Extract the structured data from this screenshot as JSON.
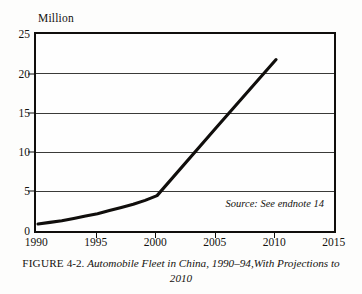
{
  "unit_label": "Million",
  "source_note": "Source: See endnote 14",
  "caption": {
    "figure_label": "FIGURE",
    "figure_number": "4-2.",
    "title": "Automobile Fleet in China, 1990–94,With Projections to 2010"
  },
  "colors": {
    "line": "#100e0c",
    "frame": "#100e0c",
    "grid": "#3a3a38",
    "background": "#fdfdfc",
    "plot_background": "#fefefe",
    "text": "#14120f"
  },
  "chart_data": {
    "type": "line",
    "title": "Automobile Fleet in China, 1990–94,With Projections to 2010",
    "xlabel": "",
    "ylabel": "Million",
    "xlim": [
      1990,
      2015
    ],
    "ylim": [
      0,
      25
    ],
    "xticks": [
      1990,
      1995,
      2000,
      2005,
      2010,
      2015
    ],
    "yticks": [
      0,
      5,
      10,
      15,
      20,
      25
    ],
    "xtick_labels": [
      "1990",
      "1995",
      "2000",
      "2005",
      "2010",
      "2015"
    ],
    "ytick_labels": [
      "0",
      "5",
      "10",
      "15",
      "20",
      "25"
    ],
    "grid": "horizontal",
    "legend": "none",
    "annotations": [
      "Source: See endnote 14"
    ],
    "series": [
      {
        "name": "Automobile fleet",
        "x": [
          1990,
          1991,
          1992,
          1993,
          1994,
          1995,
          1996,
          1997,
          1998,
          1999,
          2000,
          2005,
          2010
        ],
        "values": [
          1.1,
          1.3,
          1.5,
          1.8,
          2.1,
          2.4,
          2.8,
          3.2,
          3.6,
          4.1,
          4.7,
          13.4,
          22.0
        ]
      }
    ]
  }
}
